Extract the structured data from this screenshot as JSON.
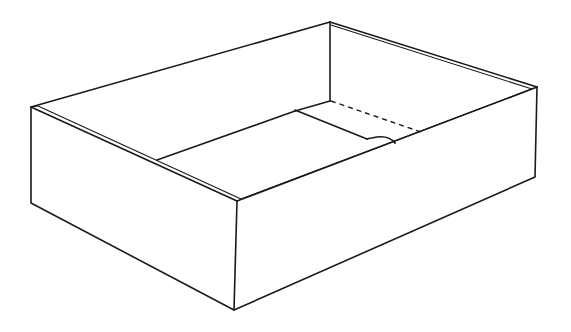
{
  "figure": {
    "subject": "Open rectangular box (tray) line drawing",
    "line_color": "#1a1a1a",
    "background": "#ffffff",
    "parts": [
      {
        "name": "front-left wall"
      },
      {
        "name": "front-right wall"
      },
      {
        "name": "back-left wall"
      },
      {
        "name": "back-right wall"
      },
      {
        "name": "floor"
      },
      {
        "name": "floor flap with half-circle notch"
      },
      {
        "name": "dashed fold line"
      }
    ]
  }
}
